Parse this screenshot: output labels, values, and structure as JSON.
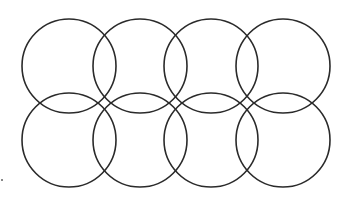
{
  "diagram": {
    "stroke_color": "#2a2a2a",
    "stroke_width": 1.6,
    "background": "#ffffff",
    "radius": 47,
    "circles": [
      {
        "row": 1,
        "cx": 69,
        "cy": 66
      },
      {
        "row": 1,
        "cx": 140,
        "cy": 66
      },
      {
        "row": 1,
        "cx": 211,
        "cy": 66
      },
      {
        "row": 1,
        "cx": 283,
        "cy": 66
      },
      {
        "row": 2,
        "cx": 69,
        "cy": 140
      },
      {
        "row": 2,
        "cx": 140,
        "cy": 140
      },
      {
        "row": 2,
        "cx": 211,
        "cy": 140
      },
      {
        "row": 2,
        "cx": 283,
        "cy": 140
      }
    ],
    "stray_dot": {
      "x": 2,
      "y": 180
    }
  }
}
